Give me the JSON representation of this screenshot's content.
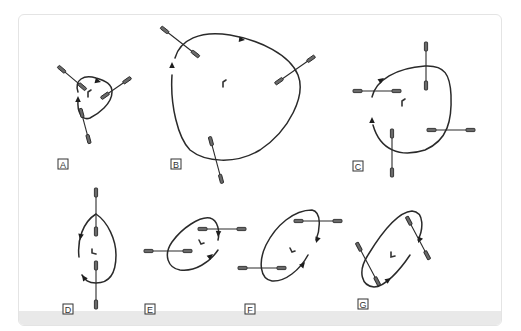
{
  "figure": {
    "background": "#ffffff",
    "card_border": "#e4e4e4",
    "footer_band_color": "#e9e9e9",
    "stroke_color": "#2a2a2a",
    "panels": [
      {
        "id": "A",
        "label": "A",
        "description": "small triangular loop, three crossing probes, counter-clockwise arrows"
      },
      {
        "id": "B",
        "label": "B",
        "description": "large rounded-triangle loop, three crossing probes"
      },
      {
        "id": "C",
        "label": "C",
        "description": "rounded-square loop, four axis-aligned crossing probes"
      },
      {
        "id": "D",
        "label": "D",
        "description": "vertical oval loop, two vertical probes top and bottom"
      },
      {
        "id": "E",
        "label": "E",
        "description": "tilted oval loop, two horizontal probes"
      },
      {
        "id": "F",
        "label": "F",
        "description": "steeper tilted oval loop, two horizontal probes"
      },
      {
        "id": "G",
        "label": "G",
        "description": "elongated diagonal loop, two diagonal crossing probes"
      }
    ]
  }
}
